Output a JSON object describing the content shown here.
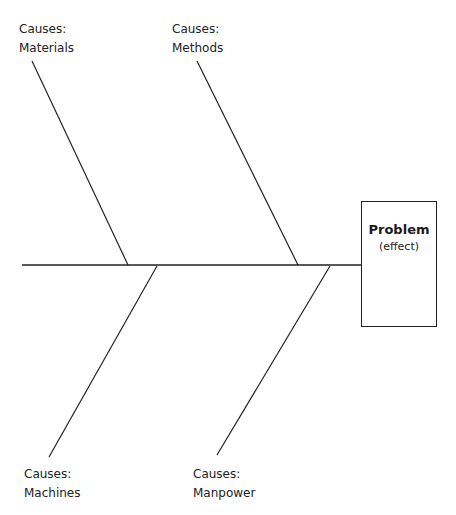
{
  "diagram": {
    "type": "fishbone",
    "effect": {
      "title": "Problem",
      "subtitle": "(effect)"
    },
    "causes": [
      {
        "prefix": "Causes:",
        "name": "Materials",
        "position": "top-left"
      },
      {
        "prefix": "Causes:",
        "name": "Methods",
        "position": "top-right"
      },
      {
        "prefix": "Causes:",
        "name": "Machines",
        "position": "bottom-left"
      },
      {
        "prefix": "Causes:",
        "name": "Manpower",
        "position": "bottom-right"
      }
    ]
  }
}
